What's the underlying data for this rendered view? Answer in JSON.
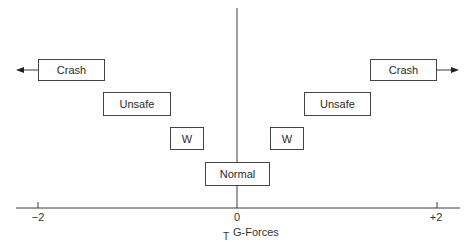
{
  "diagram": {
    "axis": {
      "title": "G-Forces",
      "title_prefix": "T",
      "ticks": [
        {
          "label": "−2",
          "value": -2
        },
        {
          "label": "0",
          "value": 0
        },
        {
          "label": "+2",
          "value": 2
        }
      ]
    },
    "zones": {
      "left": [
        {
          "label": "Crash",
          "arrow": "left"
        },
        {
          "label": "Unsafe"
        },
        {
          "label": "W"
        }
      ],
      "center": {
        "label": "Normal"
      },
      "right": [
        {
          "label": "W"
        },
        {
          "label": "Unsafe"
        },
        {
          "label": "Crash",
          "arrow": "right"
        }
      ]
    },
    "colors": {
      "line": "#3a3a3a",
      "box_border": "#444444",
      "background": "#ffffff"
    }
  }
}
